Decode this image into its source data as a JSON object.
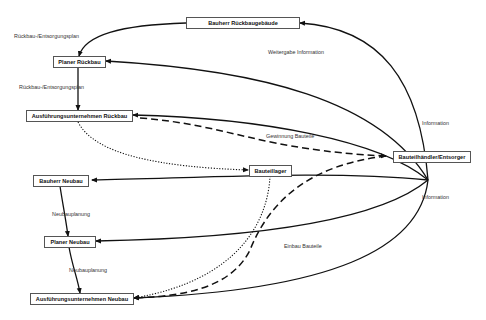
{
  "nodes": {
    "bauherr_rueckbau": "Bauherr Rückbaugebäude",
    "planer_rueckbau": "Planer Rückbau",
    "ausf_rueckbau": "Ausführungsunternehmen Rückbau",
    "bauteillager": "Bauteillager",
    "haendler": "Bauteilhändler/Entsorger",
    "bauherr_neubau": "Bauherr Neubau",
    "planer_neubau": "Planer Neubau",
    "ausf_neubau": "Ausführungsunternehmen Neubau"
  },
  "labels": {
    "plan1": "Rückbau-/Entsorgungsplan",
    "plan2": "Rückbau-/Entsorgungsplan",
    "weitergabe": "Weitergabe Information",
    "information_top": "Information",
    "gewinnung": "Gewinnung Bauteile",
    "information_bottom": "Information",
    "neubauplanung1": "Neubauplanung",
    "neubauplanung2": "Neubauplanung",
    "einbau": "Einbau Bauteile"
  },
  "colors": {
    "line": "#111111",
    "box_border": "#555555"
  }
}
